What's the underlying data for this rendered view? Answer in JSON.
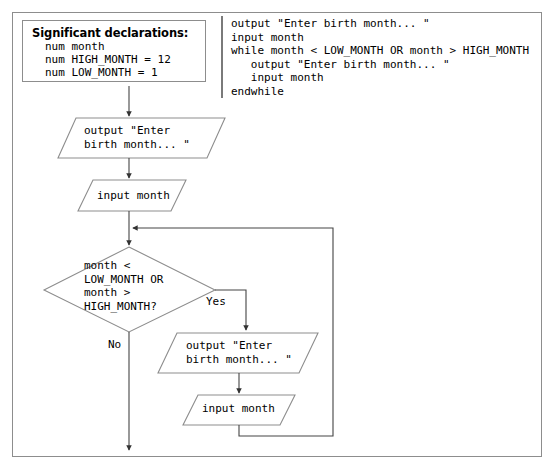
{
  "figure": {
    "type": "flowchart-with-pseudocode",
    "stroke_color": "#8d8d8d",
    "line_color": "#444444",
    "text_color": "#000000",
    "background": "#ffffff"
  },
  "declarations": {
    "title": "Significant declarations:",
    "lines": [
      "num month",
      "num HIGH_MONTH = 12",
      "num LOW_MONTH = 1"
    ]
  },
  "pseudocode": {
    "text": "output \"Enter birth month... \"\ninput month\nwhile month < LOW_MONTH OR month > HIGH_MONTH\n   output \"Enter birth month... \"\n   input month\nendwhile"
  },
  "flowchart": {
    "nodes": [
      {
        "id": "output-1",
        "shape": "parallelogram",
        "label": "output \"Enter\nbirth month... \""
      },
      {
        "id": "input-1",
        "shape": "parallelogram",
        "label": "input month"
      },
      {
        "id": "decision",
        "shape": "diamond",
        "label": "month <\nLOW_MONTH OR\nmonth >\nHIGH_MONTH?"
      },
      {
        "id": "output-2",
        "shape": "parallelogram",
        "label": "output \"Enter\nbirth month... \""
      },
      {
        "id": "input-2",
        "shape": "parallelogram",
        "label": "input month"
      }
    ],
    "branch_labels": {
      "yes": "Yes",
      "no": "No"
    }
  }
}
